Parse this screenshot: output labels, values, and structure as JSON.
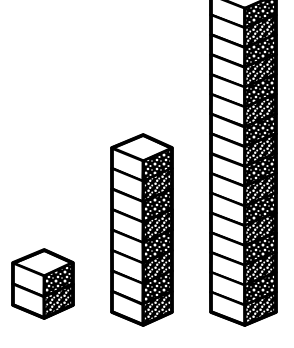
{
  "figure": {
    "style": "hand-drawn black ink line art",
    "background_color": "#ffffff",
    "ink_color": "#000000",
    "texture_note": "grainy speckled shading on right-hand faces"
  },
  "chart_data": {
    "type": "bar",
    "title": "",
    "xlabel": "",
    "ylabel": "",
    "categories": [
      "small",
      "medium",
      "tall"
    ],
    "values": [
      2,
      8,
      16
    ],
    "unit": "blocks",
    "ylim": [
      0,
      16
    ],
    "grid": false,
    "legend": null,
    "render": "isometric stacked cubes",
    "series": [
      {
        "name": "block count",
        "values": [
          2,
          8,
          16
        ]
      }
    ]
  },
  "towers": [
    {
      "id": "tower-small",
      "label": "small tower",
      "blocks": 2,
      "left": 13,
      "width": 60,
      "base_y": 318,
      "block_height": 21
    },
    {
      "id": "tower-medium",
      "label": "medium tower",
      "blocks": 8,
      "left": 112,
      "width": 60,
      "base_y": 325,
      "block_height": 20.5
    },
    {
      "id": "tower-tall",
      "label": "tall tower",
      "blocks": 16,
      "left": 211,
      "width": 65,
      "base_y": 325,
      "block_height": 19.8
    }
  ],
  "geometry": {
    "top_face_drop": 13,
    "stroke_width": 3.2,
    "inner_stroke_width": 2.4
  }
}
